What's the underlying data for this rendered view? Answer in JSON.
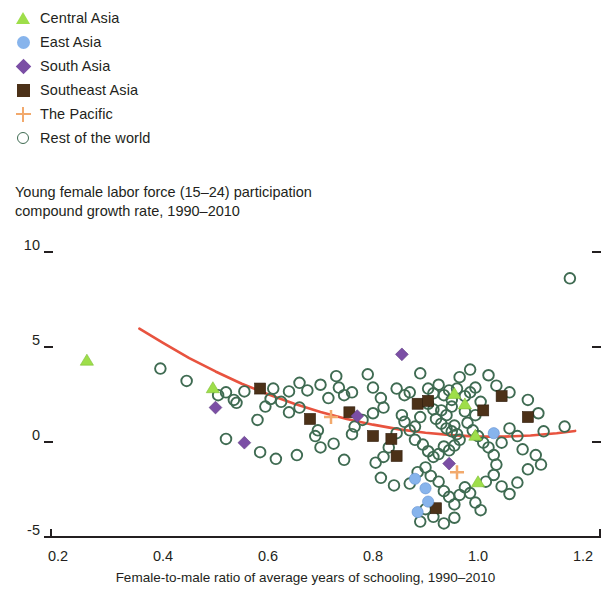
{
  "legend": {
    "items": [
      {
        "label": "Central Asia",
        "icon": "triangle-marker",
        "color": "#9ede4a"
      },
      {
        "label": "East Asia",
        "icon": "circle-marker",
        "color": "#87b4ec"
      },
      {
        "label": "South Asia",
        "icon": "diamond-marker",
        "color": "#7b4ea5"
      },
      {
        "label": "Southeast Asia",
        "icon": "square-marker",
        "color": "#4c3118"
      },
      {
        "label": "The Pacific",
        "icon": "plus-marker",
        "color": "#f2a96c"
      },
      {
        "label": "Rest of the world",
        "icon": "ring-marker",
        "color": "#3f6b52"
      }
    ]
  },
  "chart_data": {
    "type": "scatter",
    "title": "Young female labor force (15–24) participation compound growth rate, 1990–2010",
    "title_line1": "Young female labor force (15–24) participation",
    "title_line2": "compound growth rate, 1990–2010",
    "xlabel": "Female-to-male ratio of average years of schooling, 1990–2010",
    "ylabel": "",
    "xlim": [
      0.16,
      1.24
    ],
    "ylim": [
      -5.6,
      10.6
    ],
    "xticks": [
      0.2,
      0.4,
      0.6,
      0.8,
      1.0,
      1.2
    ],
    "xtick_labels": [
      "0.2",
      "0.4",
      "0.6",
      "0.8",
      "1.0",
      "1.2"
    ],
    "yticks": [
      10,
      5,
      0,
      -5
    ],
    "ytick_labels": [
      "10",
      "5",
      "0",
      "-5"
    ],
    "grid": false,
    "legend_position": "above-plot",
    "trendline": {
      "name": "quadratic fit",
      "color": "#e8533f",
      "width": 2.6,
      "points": [
        [
          0.355,
          5.7
        ],
        [
          0.4,
          4.95
        ],
        [
          0.45,
          4.15
        ],
        [
          0.5,
          3.45
        ],
        [
          0.55,
          2.8
        ],
        [
          0.6,
          2.25
        ],
        [
          0.65,
          1.75
        ],
        [
          0.7,
          1.32
        ],
        [
          0.75,
          0.95
        ],
        [
          0.8,
          0.65
        ],
        [
          0.85,
          0.4
        ],
        [
          0.9,
          0.22
        ],
        [
          0.95,
          0.1
        ],
        [
          1.0,
          0.02
        ],
        [
          1.05,
          0.02
        ],
        [
          1.1,
          0.08
        ],
        [
          1.15,
          0.2
        ],
        [
          1.185,
          0.32
        ]
      ]
    },
    "series": [
      {
        "name": "Central Asia",
        "marker": "triangle",
        "color": "#9ede4a",
        "points": [
          [
            0.255,
            4.0
          ],
          [
            0.495,
            2.55
          ],
          [
            0.955,
            2.25
          ],
          [
            0.975,
            1.7
          ],
          [
            0.995,
            0.05
          ],
          [
            1.0,
            -2.4
          ]
        ]
      },
      {
        "name": "East Asia",
        "marker": "circle",
        "color": "#87b4ec",
        "points": [
          [
            1.03,
            0.2
          ],
          [
            0.88,
            -2.2
          ],
          [
            0.9,
            -2.7
          ],
          [
            0.905,
            -3.4
          ],
          [
            0.885,
            -3.95
          ]
        ]
      },
      {
        "name": "South Asia",
        "marker": "diamond",
        "color": "#7b4ea5",
        "points": [
          [
            0.5,
            1.55
          ],
          [
            0.555,
            -0.3
          ],
          [
            0.77,
            1.1
          ],
          [
            0.855,
            4.35
          ],
          [
            0.945,
            -1.4
          ]
        ]
      },
      {
        "name": "Southeast Asia",
        "marker": "square",
        "color": "#4c3118",
        "points": [
          [
            0.585,
            2.55
          ],
          [
            0.68,
            0.95
          ],
          [
            0.755,
            1.3
          ],
          [
            0.8,
            0.05
          ],
          [
            0.835,
            -0.1
          ],
          [
            0.885,
            1.75
          ],
          [
            0.905,
            1.9
          ],
          [
            0.845,
            -1.0
          ],
          [
            1.045,
            2.15
          ],
          [
            1.095,
            1.05
          ],
          [
            0.92,
            -3.75
          ],
          [
            1.01,
            1.4
          ]
        ]
      },
      {
        "name": "The Pacific",
        "marker": "plus",
        "color": "#f2a96c",
        "points": [
          [
            0.72,
            1.05
          ],
          [
            0.96,
            -1.85
          ]
        ]
      },
      {
        "name": "Rest of the world",
        "marker": "ring",
        "color": "#3f6b52",
        "points": [
          [
            1.175,
            8.35
          ],
          [
            0.395,
            3.6
          ],
          [
            0.445,
            2.95
          ],
          [
            0.52,
            2.35
          ],
          [
            0.535,
            1.95
          ],
          [
            0.54,
            1.8
          ],
          [
            0.505,
            2.2
          ],
          [
            0.555,
            2.4
          ],
          [
            0.61,
            2.55
          ],
          [
            0.605,
            2.0
          ],
          [
            0.625,
            1.85
          ],
          [
            0.64,
            2.4
          ],
          [
            0.595,
            1.6
          ],
          [
            0.58,
            0.9
          ],
          [
            0.66,
            2.85
          ],
          [
            0.675,
            2.45
          ],
          [
            0.7,
            2.75
          ],
          [
            0.715,
            2.05
          ],
          [
            0.695,
            0.35
          ],
          [
            0.735,
            2.6
          ],
          [
            0.745,
            2.2
          ],
          [
            0.76,
            2.35
          ],
          [
            0.73,
            3.2
          ],
          [
            0.79,
            3.3
          ],
          [
            0.8,
            2.6
          ],
          [
            0.815,
            2.05
          ],
          [
            0.82,
            1.55
          ],
          [
            0.8,
            1.25
          ],
          [
            0.78,
            0.9
          ],
          [
            0.765,
            0.55
          ],
          [
            0.76,
            0.15
          ],
          [
            0.725,
            -0.35
          ],
          [
            0.7,
            -0.55
          ],
          [
            0.69,
            0.05
          ],
          [
            0.745,
            -1.2
          ],
          [
            0.655,
            -0.95
          ],
          [
            0.845,
            2.55
          ],
          [
            0.86,
            2.2
          ],
          [
            0.87,
            2.35
          ],
          [
            0.89,
            3.35
          ],
          [
            0.905,
            2.55
          ],
          [
            0.915,
            2.3
          ],
          [
            0.925,
            2.75
          ],
          [
            0.935,
            2.2
          ],
          [
            0.945,
            2.45
          ],
          [
            0.95,
            1.95
          ],
          [
            0.905,
            1.75
          ],
          [
            0.915,
            1.45
          ],
          [
            0.93,
            1.4
          ],
          [
            0.94,
            1.15
          ],
          [
            0.95,
            1.6
          ],
          [
            0.96,
            2.55
          ],
          [
            0.975,
            2.15
          ],
          [
            0.985,
            2.35
          ],
          [
            0.995,
            2.6
          ],
          [
            1.005,
            1.85
          ],
          [
            0.92,
            0.95
          ],
          [
            0.93,
            0.7
          ],
          [
            0.94,
            0.45
          ],
          [
            0.95,
            0.3
          ],
          [
            0.955,
            0.6
          ],
          [
            0.96,
            0.15
          ],
          [
            0.965,
            -0.15
          ],
          [
            0.955,
            -0.45
          ],
          [
            0.945,
            -0.7
          ],
          [
            0.935,
            -0.5
          ],
          [
            0.925,
            -0.9
          ],
          [
            0.915,
            -1.05
          ],
          [
            0.905,
            -0.75
          ],
          [
            0.895,
            -0.4
          ],
          [
            0.88,
            -0.15
          ],
          [
            0.87,
            0.35
          ],
          [
            0.86,
            0.8
          ],
          [
            0.855,
            1.15
          ],
          [
            0.98,
            0.75
          ],
          [
            0.99,
            0.35
          ],
          [
            1.0,
            0.05
          ],
          [
            1.01,
            -0.3
          ],
          [
            1.02,
            -0.55
          ],
          [
            1.03,
            -0.95
          ],
          [
            1.035,
            -1.45
          ],
          [
            1.045,
            -0.3
          ],
          [
            1.06,
            0.45
          ],
          [
            1.075,
            0.05
          ],
          [
            1.085,
            -0.65
          ],
          [
            1.11,
            -0.95
          ],
          [
            1.125,
            0.3
          ],
          [
            1.115,
            1.25
          ],
          [
            1.095,
            1.95
          ],
          [
            1.06,
            2.35
          ],
          [
            1.035,
            2.7
          ],
          [
            1.02,
            3.25
          ],
          [
            0.985,
            3.55
          ],
          [
            0.965,
            3.15
          ],
          [
            0.88,
            0.55
          ],
          [
            0.845,
            0.2
          ],
          [
            0.83,
            -0.55
          ],
          [
            0.82,
            -1.05
          ],
          [
            0.805,
            -1.35
          ],
          [
            0.815,
            -2.15
          ],
          [
            0.84,
            -2.55
          ],
          [
            0.87,
            -2.45
          ],
          [
            0.885,
            -1.85
          ],
          [
            0.9,
            -1.6
          ],
          [
            0.91,
            -2.05
          ],
          [
            0.925,
            -2.35
          ],
          [
            0.935,
            -2.85
          ],
          [
            0.945,
            -3.15
          ],
          [
            0.955,
            -3.55
          ],
          [
            0.965,
            -3.05
          ],
          [
            0.975,
            -2.65
          ],
          [
            0.985,
            -2.95
          ],
          [
            0.995,
            -3.45
          ],
          [
            1.005,
            -3.85
          ],
          [
            0.955,
            -4.25
          ],
          [
            0.935,
            -4.55
          ],
          [
            0.915,
            -4.2
          ],
          [
            0.9,
            -3.8
          ],
          [
            0.89,
            -4.45
          ],
          [
            1.015,
            -2.35
          ],
          [
            1.03,
            -2.0
          ],
          [
            1.045,
            -2.6
          ],
          [
            1.06,
            -3.0
          ],
          [
            1.075,
            -2.4
          ],
          [
            1.095,
            -1.7
          ],
          [
            1.12,
            -1.45
          ],
          [
            0.615,
            -1.15
          ],
          [
            0.585,
            -0.8
          ],
          [
            0.64,
            1.3
          ],
          [
            0.66,
            1.55
          ],
          [
            0.52,
            -0.1
          ],
          [
            1.165,
            0.55
          ],
          [
            0.995,
            1.15
          ],
          [
            0.975,
            1.35
          ],
          [
            0.89,
            1.05
          ]
        ]
      }
    ]
  }
}
